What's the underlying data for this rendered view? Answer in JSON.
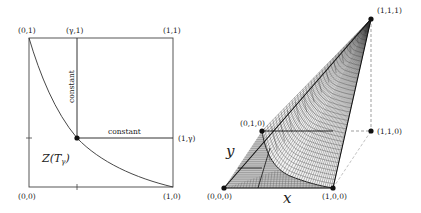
{
  "left_panel": {
    "corners": {
      "top_left": "(0,1)",
      "top_gamma": "(γ,1)",
      "top_right": "(1,1)",
      "right_gamma": "(1,γ)",
      "bottom_left": "(0,0)",
      "bottom_right": "(1,0)"
    },
    "vertical_line_label": "constant",
    "horizontal_line_label": "constant",
    "region_label": "Z(T",
    "region_label_sub": "γ",
    "region_label_close": ")"
  },
  "right_panel": {
    "vertices": {
      "v111": "(1,1,1)",
      "v010": "(0,1,0)",
      "v110": "(1,1,0)",
      "v000": "(0,0,0)",
      "v100": "(1,0,0)"
    },
    "axis_x": "x",
    "axis_y": "y"
  },
  "colors": {
    "line": "#222222",
    "dashed": "#777777",
    "mesh": "#333333",
    "flat_fill": "#bfbfbf"
  }
}
